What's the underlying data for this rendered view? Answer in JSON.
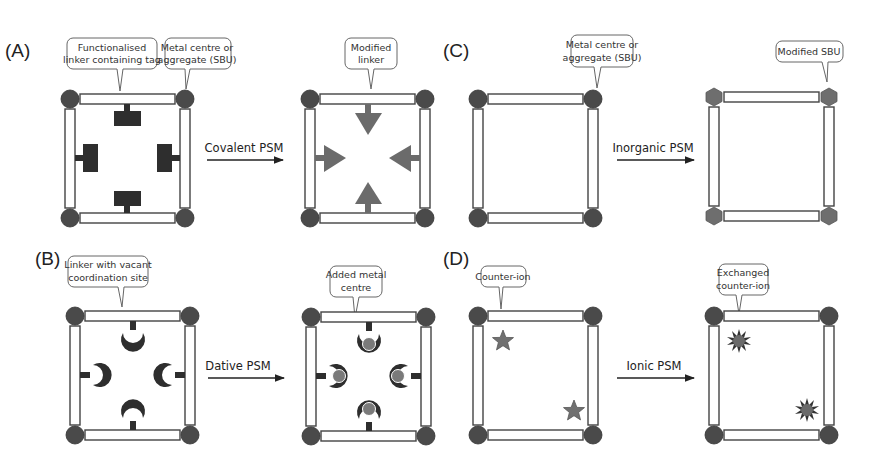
{
  "figure": {
    "panels": [
      {
        "id": "A",
        "label": "(A)",
        "before_callouts": [
          "Functionalised",
          "linker containing tag",
          "Metal centre or",
          "aggregate (SBU)"
        ],
        "arrow_label": "Covalent PSM",
        "after_callouts": [
          "Modified",
          "linker"
        ]
      },
      {
        "id": "B",
        "label": "(B)",
        "before_callouts": [
          "Linker with vacant",
          "coordination site"
        ],
        "arrow_label": "Dative PSM",
        "after_callouts": [
          "Added metal",
          "centre"
        ]
      },
      {
        "id": "C",
        "label": "(C)",
        "before_callouts": [
          "Metal centre or",
          "aggregate (SBU)"
        ],
        "arrow_label": "Inorganic PSM",
        "after_callouts": [
          "Modified SBU"
        ]
      },
      {
        "id": "D",
        "label": "(D)",
        "before_callouts": [
          "Counter-ion"
        ],
        "arrow_label": "Ionic PSM",
        "after_callouts": [
          "Exchanged",
          "counter-ion"
        ]
      }
    ]
  },
  "colors": {
    "node": "#4a4a4a",
    "tag": "#2e2e2e",
    "modified": "#6b6b6b",
    "added_metal": "#7a7a7a",
    "bar_stroke": "#444444"
  },
  "icons": {
    "metal_node": "filled-circle",
    "modified_sbu": "hexagon",
    "tag": "T-block",
    "modified_linker": "arrowhead",
    "vacant_site": "crescent",
    "counter_ion": "star",
    "exchanged_ion": "starburst"
  }
}
